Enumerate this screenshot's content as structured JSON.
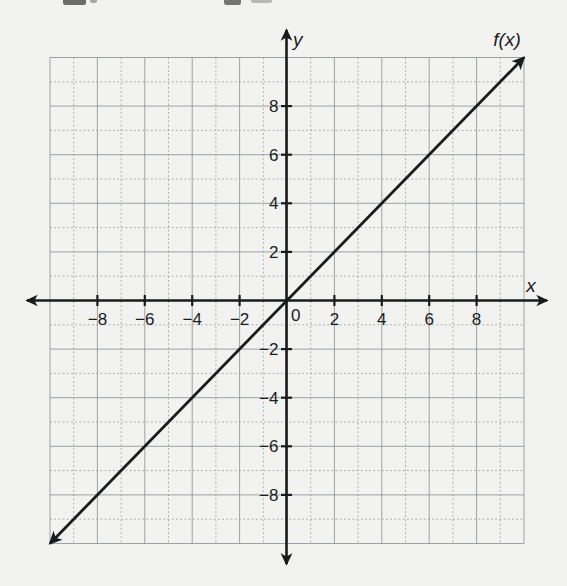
{
  "figure": {
    "kind": "scanned-textbook-coordinate-plane",
    "description_visible_text_only": true
  },
  "colors": {
    "paper": "#f2f3f0",
    "ink": "#1a1b1d",
    "grid": "#8f9399",
    "text": "#1b1c1e"
  },
  "artifacts": {
    "cropped_text_fragments": [
      {
        "x": 63,
        "w": 23,
        "h": 5,
        "opacity": 0.8
      },
      {
        "x": 90,
        "w": 7,
        "h": 3,
        "opacity": 0.45
      },
      {
        "x": 224,
        "w": 17,
        "h": 5,
        "opacity": 0.75
      },
      {
        "x": 251,
        "w": 21,
        "h": 3,
        "opacity": 0.35
      }
    ]
  },
  "chart_data": {
    "type": "line",
    "title": "",
    "xlabel": "x",
    "ylabel": "y",
    "origin_label": "0",
    "xlim": [
      -10,
      10
    ],
    "ylim": [
      -10,
      10
    ],
    "grid": true,
    "grid_step": 1,
    "tick_step": 2,
    "x_tick_labels": [
      -8,
      -6,
      -4,
      -2,
      2,
      4,
      6,
      8
    ],
    "y_tick_labels": [
      8,
      6,
      4,
      2,
      -2,
      -4,
      -6,
      -8
    ],
    "axes_arrows": "both-ends",
    "legend_position": "none",
    "series": [
      {
        "name": "f(x)",
        "equation": "f(x) = x",
        "slope": 1,
        "intercept": 0,
        "arrow_ends": "both",
        "segment_endpoints": [
          [
            -10,
            -10
          ],
          [
            10,
            10
          ]
        ],
        "points": [
          [
            -10,
            -10
          ],
          [
            -8,
            -8
          ],
          [
            -6,
            -6
          ],
          [
            -4,
            -4
          ],
          [
            -2,
            -2
          ],
          [
            0,
            0
          ],
          [
            2,
            2
          ],
          [
            4,
            4
          ],
          [
            6,
            6
          ],
          [
            8,
            8
          ],
          [
            10,
            10
          ]
        ]
      }
    ]
  }
}
